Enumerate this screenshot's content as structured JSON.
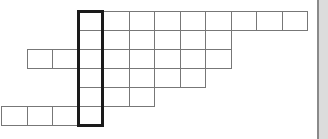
{
  "puzzle": {
    "type": "crossword-grid",
    "cell_width": 25.5,
    "cell_height": 19,
    "origin_x": 1,
    "origin_y": 11,
    "rows": [
      {
        "row": 0,
        "start_col": 3,
        "end_col": 11
      },
      {
        "row": 1,
        "start_col": 3,
        "end_col": 8
      },
      {
        "row": 2,
        "start_col": 1,
        "end_col": 8
      },
      {
        "row": 3,
        "start_col": 3,
        "end_col": 7
      },
      {
        "row": 4,
        "start_col": 3,
        "end_col": 5
      },
      {
        "row": 5,
        "start_col": 0,
        "end_col": 3
      }
    ],
    "highlighted_column": {
      "col": 3,
      "start_row": 0,
      "end_row": 5
    },
    "cell_values": [],
    "colors": {
      "cell_border": "#777777",
      "highlight_border": "#1a1a1a",
      "scrollbar": "#dcdcdc"
    }
  },
  "scrollbar": {
    "orientation": "vertical"
  }
}
